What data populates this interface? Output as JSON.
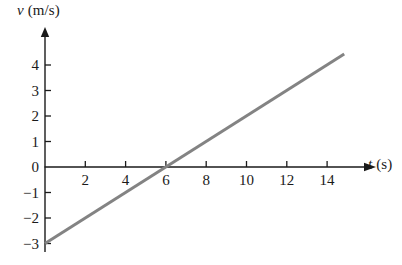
{
  "chart_data": {
    "type": "line",
    "title": "",
    "subtitle": "",
    "xlabel_symbol": "t",
    "xlabel_unit": "(s)",
    "ylabel_symbol": "v",
    "ylabel_unit": "(m/s)",
    "xlabel": "t (s)",
    "ylabel": "v (m/s)",
    "xlim": [
      0,
      15.8
    ],
    "ylim": [
      -3.3,
      4.8
    ],
    "xticks": [
      2,
      4,
      6,
      8,
      10,
      12,
      14
    ],
    "yticks": [
      4,
      3,
      2,
      1,
      0,
      -1,
      -2,
      -3
    ],
    "xtick_labels": [
      "2",
      "4",
      "6",
      "8",
      "10",
      "12",
      "14"
    ],
    "ytick_labels": [
      "4",
      "3",
      "2",
      "1",
      "0",
      "−1",
      "−2",
      "−3"
    ],
    "grid": false,
    "legend": false,
    "legend_position": "none",
    "axis_arrows": true,
    "series": [
      {
        "name": "velocity",
        "color": "#838383",
        "line_width": 3,
        "x": [
          0,
          14.85
        ],
        "y": [
          -3.0,
          4.43
        ],
        "slope": 0.5,
        "intercept": -3.0,
        "x_intercept": 6.0,
        "points": [
          {
            "x": 0,
            "y": -3.0
          },
          {
            "x": 2,
            "y": -2.0
          },
          {
            "x": 4,
            "y": -1.0
          },
          {
            "x": 6,
            "y": 0.0
          },
          {
            "x": 8,
            "y": 1.0
          },
          {
            "x": 10,
            "y": 2.0
          },
          {
            "x": 12,
            "y": 3.0
          },
          {
            "x": 14,
            "y": 4.0
          },
          {
            "x": 14.85,
            "y": 4.43
          }
        ]
      }
    ],
    "annotations": [],
    "axis_color": "#1a1a1a",
    "background": "#ffffff"
  },
  "geometry": {
    "origin_x": 45,
    "origin_y": 167,
    "px_per_x_unit": 20.15,
    "px_per_y_unit": 25.5,
    "y_axis_top": 33,
    "x_axis_right": 366,
    "tick_len": 6
  }
}
